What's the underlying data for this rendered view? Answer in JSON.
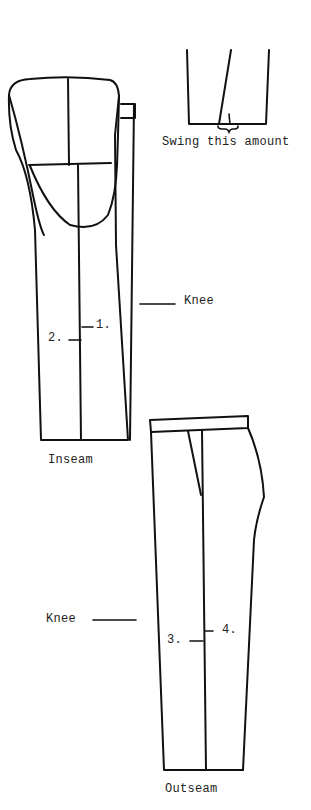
{
  "diagram": {
    "type": "trouser-pattern-alteration",
    "colors": {
      "line": "#111111",
      "text": "#222222",
      "background": "#ffffff"
    },
    "labels": {
      "swing": "Swing this amount",
      "knee_upper": "Knee",
      "marker_1": "1.",
      "marker_2": "2.",
      "inseam": "Inseam",
      "knee_lower": "Knee",
      "marker_3": "3.",
      "marker_4": "4.",
      "outseam": "Outseam"
    },
    "figures": [
      {
        "id": "hem-detail",
        "caption": "Swing this amount"
      },
      {
        "id": "inseam-view",
        "caption": "Inseam",
        "markers": [
          "1.",
          "2."
        ],
        "knee_label": "Knee"
      },
      {
        "id": "outseam-view",
        "caption": "Outseam",
        "markers": [
          "3.",
          "4."
        ],
        "knee_label": "Knee"
      }
    ]
  }
}
